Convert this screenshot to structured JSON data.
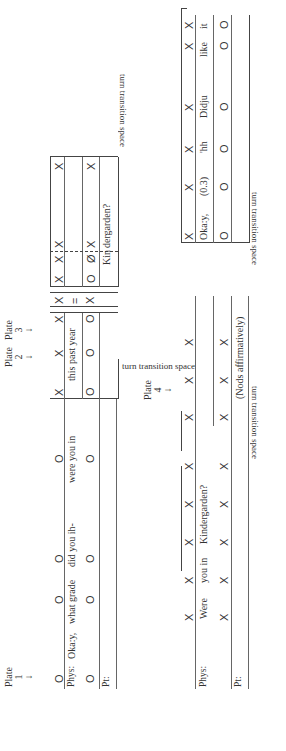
{
  "figure": {
    "row1": {
      "plates": [
        {
          "label": "Plate",
          "number": "1"
        },
        {
          "label": "Plate",
          "number": "2"
        },
        {
          "label": "Plate",
          "number": "3"
        }
      ],
      "speakers": {
        "phys": "Phys:",
        "pt": "Pt:"
      },
      "segment_a": {
        "marks_top": [
          "O",
          "O",
          "O",
          "O"
        ],
        "phys_words": [
          "Oka:y,",
          "what grade",
          "did you ih-",
          "were you in"
        ],
        "marks_bottom": [
          "O",
          "O",
          "O",
          "O"
        ]
      },
      "segment_b": {
        "marks_top": [
          "X",
          "X",
          "X"
        ],
        "phys_words": [
          "this past year"
        ],
        "marks_bottom": [
          "O",
          "O",
          "O"
        ]
      },
      "tts_label": "turn transition space",
      "segment_c": {
        "marks_top": [
          "X"
        ],
        "equals": "=",
        "marks_bottom": [
          "X"
        ]
      },
      "segment_d": {
        "marks_top": [
          "X",
          "X",
          "X",
          "X"
        ],
        "marks_mid": [
          "O",
          "Ø",
          "X",
          "X"
        ],
        "pt_words": [
          "Kin",
          "dergarden?"
        ]
      },
      "tts_label_end": "turn transition space"
    },
    "row2": {
      "plates": [
        {
          "label": "Plate",
          "number": "4"
        }
      ],
      "speakers": {
        "phys": "Phys:",
        "pt": "Pt:"
      },
      "segment_a": {
        "marks_top": [
          "X",
          "X",
          "X",
          "X",
          "X"
        ],
        "phys_words": [
          "Were",
          "you in",
          "Kindergarden?"
        ],
        "marks_bottom": [
          "X",
          "X",
          "X",
          "X",
          "X"
        ]
      },
      "tts_label": "turn transition space",
      "segment_b": {
        "marks_top": [
          "X",
          "X",
          "X"
        ],
        "marks_mid": [
          "X",
          "X",
          "X"
        ],
        "pt_words": [
          "(Nods affirmatively)"
        ]
      },
      "tts_label_2": "turn transition space",
      "segment_c": {
        "marks_top": [
          "X",
          "X",
          "X",
          "X",
          "X",
          "X"
        ],
        "phys_words": [
          "Oka:y,",
          "(0.3)",
          "'hh",
          "Didju",
          "like",
          "it"
        ],
        "marks_bottom": [
          "O",
          "O",
          "O",
          "O",
          "O",
          "O"
        ]
      }
    }
  }
}
